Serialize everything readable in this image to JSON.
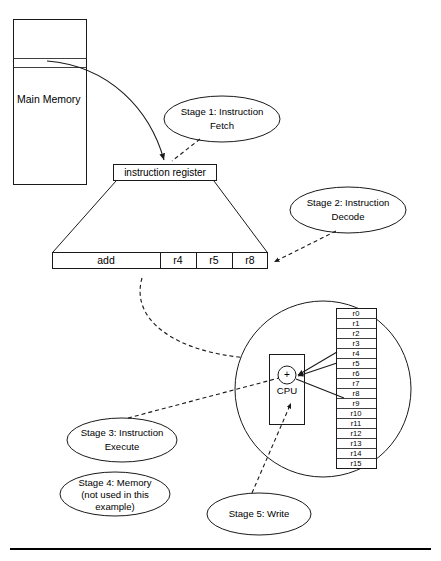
{
  "figure": {
    "memory_label": "Main Memory",
    "instruction_register_label": "instruction register",
    "cpu_label": "CPU",
    "alu_symbol": "+",
    "instruction_fields": [
      {
        "name": "opcode",
        "value": "add"
      },
      {
        "name": "operand1",
        "value": "r4"
      },
      {
        "name": "operand2",
        "value": "r5"
      },
      {
        "name": "destination",
        "value": "r8"
      }
    ],
    "registers": [
      "r0",
      "r1",
      "r2",
      "r3",
      "r4",
      "r5",
      "r6",
      "r7",
      "r8",
      "r9",
      "r10",
      "r11",
      "r12",
      "r13",
      "r14",
      "r15"
    ],
    "stages": [
      {
        "id": "stage-1",
        "line1": "Stage 1: Instruction",
        "line2": "Fetch"
      },
      {
        "id": "stage-2",
        "line1": "Stage 2: Instruction",
        "line2": "Decode"
      },
      {
        "id": "stage-3",
        "line1": "Stage 3: Instruction",
        "line2": "Execute"
      },
      {
        "id": "stage-4",
        "line1": "Stage 4: Memory",
        "line2": "(not used in this",
        "line3": "example)"
      },
      {
        "id": "stage-5",
        "line1": "Stage 5: Write",
        "line2": ""
      }
    ],
    "colors": {
      "stroke": "#1a1a1a",
      "fill": "#ffffff",
      "rule": "#000000"
    }
  }
}
